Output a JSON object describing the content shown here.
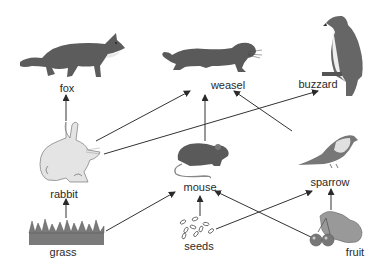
{
  "diagram": {
    "type": "food web",
    "colors": {
      "arrow": "#2a2a2a",
      "animal": "#5a5a5a",
      "light": "#d8d8d8",
      "label": "#2a2a2a"
    },
    "nodes": [
      {
        "id": "fox",
        "label": "fox",
        "x": 67,
        "y": 82
      },
      {
        "id": "weasel",
        "label": "weasel",
        "x": 228,
        "y": 79
      },
      {
        "id": "buzzard",
        "label": "buzzard",
        "x": 318,
        "y": 78
      },
      {
        "id": "rabbit",
        "label": "rabbit",
        "x": 64,
        "y": 188
      },
      {
        "id": "mouse",
        "label": "mouse",
        "x": 200,
        "y": 181
      },
      {
        "id": "sparrow",
        "label": "sparrow",
        "x": 330,
        "y": 176
      },
      {
        "id": "grass",
        "label": "grass",
        "x": 63,
        "y": 246
      },
      {
        "id": "seeds",
        "label": "seeds",
        "x": 199,
        "y": 240
      },
      {
        "id": "fruit",
        "label": "fruit",
        "x": 355,
        "y": 246
      }
    ],
    "edges": [
      {
        "from": "rabbit",
        "to": "fox"
      },
      {
        "from": "grass",
        "to": "rabbit"
      },
      {
        "from": "rabbit",
        "to": "weasel"
      },
      {
        "from": "rabbit",
        "to": "buzzard"
      },
      {
        "from": "mouse",
        "to": "weasel"
      },
      {
        "from": "sparrow",
        "to": "weasel"
      },
      {
        "from": "grass",
        "to": "mouse"
      },
      {
        "from": "seeds",
        "to": "mouse"
      },
      {
        "from": "seeds",
        "to": "sparrow"
      },
      {
        "from": "fruit",
        "to": "mouse"
      },
      {
        "from": "fruit",
        "to": "sparrow"
      }
    ]
  }
}
